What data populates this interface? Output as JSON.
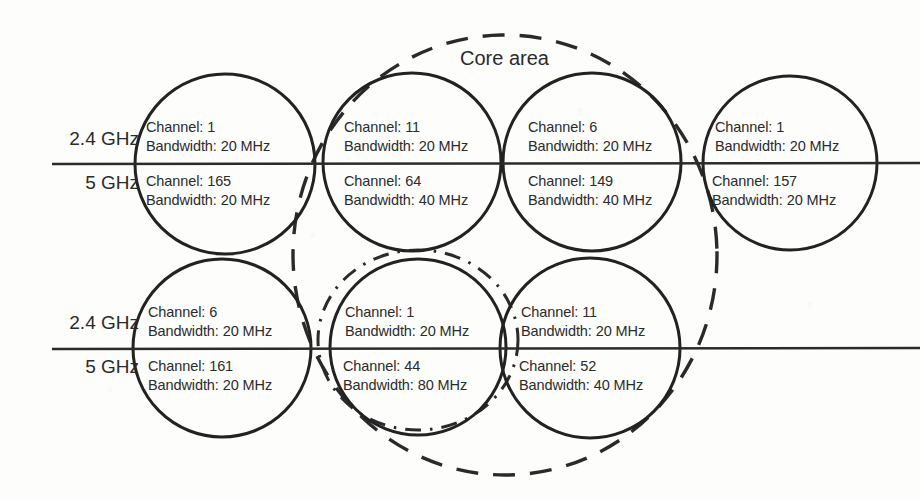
{
  "diagram": {
    "core_area_label": "Core area",
    "band_labels": {
      "upper": "2.4 GHz",
      "lower": "5 GHz"
    },
    "row_labels": [
      {
        "upper": "2.4 GHz",
        "lower": "5 GHz"
      },
      {
        "upper": "2.4 GHz",
        "lower": "5 GHz"
      }
    ],
    "field_prefixes": {
      "channel": "Channel:",
      "bandwidth": "Bandwidth:"
    },
    "colors": {
      "ink": "#2b2b2b",
      "circle_stroke": "#222222",
      "dashed_stroke": "#2a2a2a",
      "dashdot_stroke": "#2a2a2a",
      "background": "#fdfdfc"
    },
    "rows": [
      {
        "name": "top-row",
        "cells": [
          {
            "id": "cell-r1c1",
            "upper": {
              "band": "2.4 GHz",
              "channel": "1",
              "bandwidth": "20 MHz"
            },
            "lower": {
              "band": "5 GHz",
              "channel": "165",
              "bandwidth": "20 MHz"
            },
            "upper_channel_text": "Channel: 1",
            "upper_bandwidth_text": "Bandwidth: 20 MHz",
            "lower_channel_text": "Channel: 165",
            "lower_bandwidth_text": "Bandwidth: 20 MHz",
            "in_core_area": false
          },
          {
            "id": "cell-r1c2",
            "upper": {
              "band": "2.4 GHz",
              "channel": "11",
              "bandwidth": "20 MHz"
            },
            "lower": {
              "band": "5 GHz",
              "channel": "64",
              "bandwidth": "40 MHz"
            },
            "upper_channel_text": "Channel: 11",
            "upper_bandwidth_text": "Bandwidth: 20 MHz",
            "lower_channel_text": "Channel: 64",
            "lower_bandwidth_text": "Bandwidth: 40 MHz",
            "in_core_area": true
          },
          {
            "id": "cell-r1c3",
            "upper": {
              "band": "2.4 GHz",
              "channel": "6",
              "bandwidth": "20 MHz"
            },
            "lower": {
              "band": "5 GHz",
              "channel": "149",
              "bandwidth": "40 MHz"
            },
            "upper_channel_text": "Channel: 6",
            "upper_bandwidth_text": "Bandwidth: 20 MHz",
            "lower_channel_text": "Channel: 149",
            "lower_bandwidth_text": "Bandwidth: 40 MHz",
            "in_core_area": true
          },
          {
            "id": "cell-r1c4",
            "upper": {
              "band": "2.4 GHz",
              "channel": "1",
              "bandwidth": "20 MHz"
            },
            "lower": {
              "band": "5 GHz",
              "channel": "157",
              "bandwidth": "20 MHz"
            },
            "upper_channel_text": "Channel: 1",
            "upper_bandwidth_text": "Bandwidth: 20 MHz",
            "lower_channel_text": "Channel: 157",
            "lower_bandwidth_text": "Bandwidth: 20 MHz",
            "in_core_area": false
          }
        ]
      },
      {
        "name": "bottom-row",
        "cells": [
          {
            "id": "cell-r2c1",
            "upper": {
              "band": "2.4 GHz",
              "channel": "6",
              "bandwidth": "20 MHz"
            },
            "lower": {
              "band": "5 GHz",
              "channel": "161",
              "bandwidth": "20 MHz"
            },
            "upper_channel_text": "Channel: 6",
            "upper_bandwidth_text": "Bandwidth: 20 MHz",
            "lower_channel_text": "Channel: 161",
            "lower_bandwidth_text": "Bandwidth: 20 MHz",
            "in_core_area": false,
            "highlighted": false
          },
          {
            "id": "cell-r2c2",
            "upper": {
              "band": "2.4 GHz",
              "channel": "1",
              "bandwidth": "20 MHz"
            },
            "lower": {
              "band": "5 GHz",
              "channel": "44",
              "bandwidth": "80 MHz"
            },
            "upper_channel_text": "Channel: 1",
            "upper_bandwidth_text": "Bandwidth: 20 MHz",
            "lower_channel_text": "Channel: 44",
            "lower_bandwidth_text": "Bandwidth: 80 MHz",
            "in_core_area": true,
            "highlighted": true
          },
          {
            "id": "cell-r2c3",
            "upper": {
              "band": "2.4 GHz",
              "channel": "11",
              "bandwidth": "20 MHz"
            },
            "lower": {
              "band": "5 GHz",
              "channel": "52",
              "bandwidth": "40 MHz"
            },
            "upper_channel_text": "Channel: 11",
            "upper_bandwidth_text": "Bandwidth: 20 MHz",
            "lower_channel_text": "Channel: 52",
            "lower_bandwidth_text": "Bandwidth: 40 MHz",
            "in_core_area": true,
            "highlighted": false
          }
        ]
      }
    ]
  }
}
